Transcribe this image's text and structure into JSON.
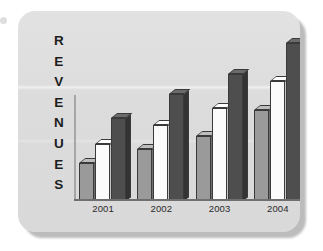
{
  "axis_label": {
    "text": "REVENUES",
    "letters": [
      "R",
      "E",
      "V",
      "E",
      "N",
      "U",
      "E",
      "S"
    ]
  },
  "colors": {
    "card_background": "#dedede",
    "series_gray": "#9a9a9a",
    "series_white": "#fbfbfb",
    "series_dark": "#4e4e4e",
    "axis": "#6f6f6f",
    "text": "#1d1d1d"
  },
  "chart_data": {
    "type": "bar",
    "title": "",
    "xlabel": "",
    "ylabel": "REVENUES",
    "categories": [
      "2001",
      "2002",
      "2003",
      "2004"
    ],
    "series": [
      {
        "name": "series-1-gray",
        "color": "#9a9a9a",
        "values": [
          22,
          30,
          38,
          53
        ]
      },
      {
        "name": "series-2-white",
        "color": "#fbfbfb",
        "values": [
          33,
          44,
          54,
          70
        ]
      },
      {
        "name": "series-3-dark",
        "color": "#4e4e4e",
        "values": [
          48,
          62,
          74,
          92
        ]
      }
    ],
    "ylim": [
      0,
      100
    ],
    "grid": false,
    "legend": "none",
    "style": "3d-extruded-bars"
  }
}
